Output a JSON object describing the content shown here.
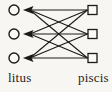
{
  "figure": {
    "background_color": "#f7f6f3",
    "ink_color": "#1c1a17",
    "node_fill": "#faf9f6"
  },
  "diagram": {
    "type": "bipartite-graph",
    "left_nodes": {
      "shape": "circle",
      "cx": 14,
      "radius": 5,
      "ys": [
        10,
        34,
        58
      ]
    },
    "right_nodes": {
      "shape": "square",
      "cx": 92.5,
      "size": 9,
      "ys": [
        10,
        34,
        58
      ]
    },
    "edges": [
      {
        "left": 0,
        "right": 0
      },
      {
        "left": 0,
        "right": 1
      },
      {
        "left": 0,
        "right": 2
      },
      {
        "left": 1,
        "right": 0
      },
      {
        "left": 1,
        "right": 1
      },
      {
        "left": 1,
        "right": 2
      },
      {
        "left": 2,
        "right": 0
      },
      {
        "left": 2,
        "right": 1
      },
      {
        "left": 2,
        "right": 2
      }
    ],
    "edge_start_x": 87.5,
    "edge_end_x": 30,
    "line_width": 1.1,
    "arrow": {
      "tip_x": 23,
      "back_x": 33.5,
      "notch_x": 31.5,
      "half_height": 3.9,
      "direction": "left"
    },
    "labels": {
      "left": {
        "text": "litus"
      },
      "right": {
        "text": "piscis"
      }
    }
  }
}
